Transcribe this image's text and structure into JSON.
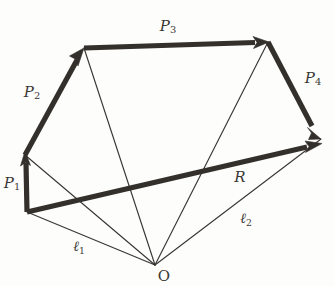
{
  "figure": {
    "background_color": "#fdfdfc",
    "stroke_color": "#33302c",
    "thin_stroke_color": "#3a3733",
    "width": 334,
    "height": 286
  },
  "vertices": {
    "A": {
      "name": "p1-tail",
      "x": 27,
      "y": 212
    },
    "B": {
      "name": "p1-head-p2-tail",
      "x": 25,
      "y": 155
    },
    "C": {
      "name": "p2-head-p3-tail",
      "x": 84,
      "y": 48
    },
    "D": {
      "name": "p3-head-p4-tail",
      "x": 268,
      "y": 42
    },
    "E": {
      "name": "p4-head-resultant-head",
      "x": 321,
      "y": 139
    },
    "O": {
      "name": "origin-point",
      "x": 155,
      "y": 265
    }
  },
  "vectors": [
    {
      "id": "P1",
      "label": "P",
      "subscript": "1",
      "label_x": 12,
      "label_y": 184,
      "style": "thick",
      "from": "A",
      "to": "B"
    },
    {
      "id": "P2",
      "label": "P",
      "subscript": "2",
      "label_x": 32,
      "label_y": 93,
      "style": "thick",
      "from": "B",
      "to": "C"
    },
    {
      "id": "P3",
      "label": "P",
      "subscript": "3",
      "label_x": 168,
      "label_y": 27,
      "style": "thick",
      "from": "C",
      "to": "D"
    },
    {
      "id": "P4",
      "label": "P",
      "subscript": "4",
      "label_x": 313,
      "label_y": 79,
      "style": "thick",
      "from": "D",
      "to": "E"
    },
    {
      "id": "R",
      "label": "R",
      "subscript": "",
      "label_x": 240,
      "label_y": 177,
      "style": "thick",
      "from": "A",
      "to": "E"
    }
  ],
  "moment_arms": [
    {
      "id": "l1",
      "label": "ℓ",
      "subscript": "1",
      "label_x": 79,
      "label_y": 247,
      "from": "O",
      "to": "A"
    },
    {
      "id": "l2",
      "label": "ℓ",
      "subscript": "2",
      "label_x": 246,
      "label_y": 219,
      "from": "O",
      "to": "E"
    }
  ],
  "rays": [
    {
      "id": "O-A",
      "from": "O",
      "to": "A"
    },
    {
      "id": "O-B",
      "from": "O",
      "to": "B"
    },
    {
      "id": "O-C",
      "from": "O",
      "to": "C"
    },
    {
      "id": "O-D",
      "from": "O",
      "to": "D"
    },
    {
      "id": "O-E",
      "from": "O",
      "to": "E"
    }
  ],
  "origin": {
    "label": "O",
    "label_x": 164,
    "label_y": 276
  }
}
